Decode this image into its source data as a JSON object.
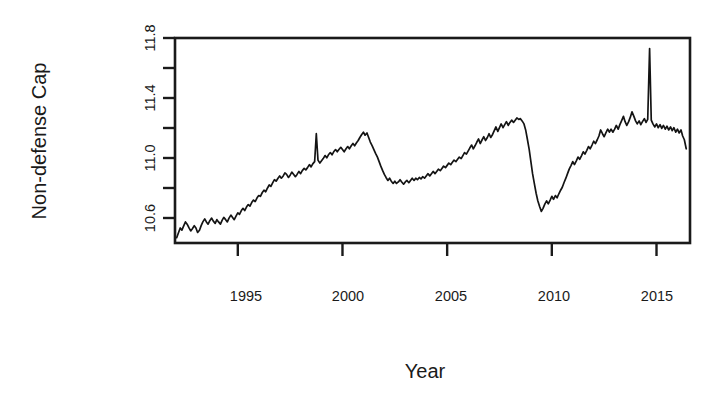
{
  "chart_data": {
    "type": "line",
    "title": "",
    "subtitle": "",
    "xlabel": "Year",
    "ylabel": "Non-defense Cap",
    "xlim": [
      1992.0,
      2016.6
    ],
    "ylim": [
      10.46,
      11.82
    ],
    "grid": false,
    "legend": null,
    "legend_position": "none",
    "xticks": [
      1995,
      2000,
      2005,
      2010,
      2015
    ],
    "xtick_labels": [
      "1995",
      "2000",
      "2005",
      "2010",
      "2015"
    ],
    "yticks": [
      10.6,
      10.8,
      11.0,
      11.2,
      11.4,
      11.6,
      11.8
    ],
    "ytick_labels": [
      "10.6",
      "",
      "11.0",
      "",
      "11.4",
      "",
      "11.8"
    ],
    "series": [
      {
        "name": "Non-defense Cap",
        "color": "#141414",
        "x": [
          1992.08,
          1992.17,
          1992.25,
          1992.33,
          1992.42,
          1992.5,
          1992.58,
          1992.67,
          1992.75,
          1992.83,
          1992.92,
          1993.0,
          1993.08,
          1993.17,
          1993.25,
          1993.33,
          1993.42,
          1993.5,
          1993.58,
          1993.67,
          1993.75,
          1993.83,
          1993.92,
          1994.0,
          1994.08,
          1994.17,
          1994.25,
          1994.33,
          1994.42,
          1994.5,
          1994.58,
          1994.67,
          1994.75,
          1994.83,
          1994.92,
          1995.0,
          1995.08,
          1995.17,
          1995.25,
          1995.33,
          1995.42,
          1995.5,
          1995.58,
          1995.67,
          1995.75,
          1995.83,
          1995.92,
          1996.0,
          1996.08,
          1996.17,
          1996.25,
          1996.33,
          1996.42,
          1996.5,
          1996.58,
          1996.67,
          1996.75,
          1996.83,
          1996.92,
          1997.0,
          1997.08,
          1997.17,
          1997.25,
          1997.33,
          1997.42,
          1997.5,
          1997.58,
          1997.67,
          1997.75,
          1997.83,
          1997.92,
          1998.0,
          1998.08,
          1998.17,
          1998.25,
          1998.33,
          1998.42,
          1998.5,
          1998.58,
          1998.67,
          1998.75,
          1998.83,
          1998.92,
          1999.0,
          1999.08,
          1999.17,
          1999.25,
          1999.33,
          1999.42,
          1999.5,
          1999.58,
          1999.67,
          1999.75,
          1999.83,
          1999.92,
          2000.0,
          2000.08,
          2000.17,
          2000.25,
          2000.33,
          2000.42,
          2000.5,
          2000.58,
          2000.67,
          2000.75,
          2000.83,
          2000.92,
          2001.0,
          2001.08,
          2001.17,
          2001.25,
          2001.33,
          2001.42,
          2001.5,
          2001.58,
          2001.67,
          2001.75,
          2001.83,
          2001.92,
          2002.0,
          2002.08,
          2002.17,
          2002.25,
          2002.33,
          2002.42,
          2002.5,
          2002.58,
          2002.67,
          2002.75,
          2002.83,
          2002.92,
          2003.0,
          2003.08,
          2003.17,
          2003.25,
          2003.33,
          2003.42,
          2003.5,
          2003.58,
          2003.67,
          2003.75,
          2003.83,
          2003.92,
          2004.0,
          2004.08,
          2004.17,
          2004.25,
          2004.33,
          2004.42,
          2004.5,
          2004.58,
          2004.67,
          2004.75,
          2004.83,
          2004.92,
          2005.0,
          2005.08,
          2005.17,
          2005.25,
          2005.33,
          2005.42,
          2005.5,
          2005.58,
          2005.67,
          2005.75,
          2005.83,
          2005.92,
          2006.0,
          2006.08,
          2006.17,
          2006.25,
          2006.33,
          2006.42,
          2006.5,
          2006.58,
          2006.67,
          2006.75,
          2006.83,
          2006.92,
          2007.0,
          2007.08,
          2007.17,
          2007.25,
          2007.33,
          2007.42,
          2007.5,
          2007.58,
          2007.67,
          2007.75,
          2007.83,
          2007.92,
          2008.0,
          2008.08,
          2008.17,
          2008.25,
          2008.33,
          2008.42,
          2008.5,
          2008.58,
          2008.67,
          2008.75,
          2008.83,
          2008.92,
          2009.0,
          2009.08,
          2009.17,
          2009.25,
          2009.33,
          2009.42,
          2009.5,
          2009.58,
          2009.67,
          2009.75,
          2009.83,
          2009.92,
          2010.0,
          2010.08,
          2010.17,
          2010.25,
          2010.33,
          2010.42,
          2010.5,
          2010.58,
          2010.67,
          2010.75,
          2010.83,
          2010.92,
          2011.0,
          2011.08,
          2011.17,
          2011.25,
          2011.33,
          2011.42,
          2011.5,
          2011.58,
          2011.67,
          2011.75,
          2011.83,
          2011.92,
          2012.0,
          2012.08,
          2012.17,
          2012.25,
          2012.33,
          2012.42,
          2012.5,
          2012.58,
          2012.67,
          2012.75,
          2012.83,
          2012.92,
          2013.0,
          2013.08,
          2013.17,
          2013.25,
          2013.33,
          2013.42,
          2013.5,
          2013.58,
          2013.67,
          2013.75,
          2013.83,
          2013.92,
          2014.0,
          2014.08,
          2014.17,
          2014.25,
          2014.33,
          2014.42,
          2014.5,
          2014.58,
          2014.67,
          2014.75,
          2014.83,
          2014.92,
          2015.0,
          2015.08,
          2015.17,
          2015.25,
          2015.33,
          2015.42,
          2015.5,
          2015.58,
          2015.67,
          2015.75,
          2015.83,
          2015.92,
          2016.0,
          2016.08,
          2016.17,
          2016.25,
          2016.33,
          2016.42
        ],
        "y": [
          10.495,
          10.53,
          10.56,
          10.545,
          10.575,
          10.6,
          10.585,
          10.56,
          10.54,
          10.555,
          10.575,
          10.56,
          10.53,
          10.545,
          10.575,
          10.6,
          10.62,
          10.6,
          10.585,
          10.61,
          10.625,
          10.605,
          10.59,
          10.615,
          10.6,
          10.585,
          10.61,
          10.63,
          10.615,
          10.6,
          10.625,
          10.645,
          10.63,
          10.615,
          10.64,
          10.66,
          10.65,
          10.675,
          10.69,
          10.675,
          10.7,
          10.715,
          10.705,
          10.73,
          10.745,
          10.735,
          10.76,
          10.775,
          10.77,
          10.795,
          10.81,
          10.8,
          10.825,
          10.845,
          10.835,
          10.86,
          10.88,
          10.87,
          10.89,
          10.905,
          10.89,
          10.905,
          10.925,
          10.915,
          10.895,
          10.91,
          10.93,
          10.915,
          10.9,
          10.915,
          10.935,
          10.92,
          10.94,
          10.955,
          10.945,
          10.96,
          10.98,
          10.965,
          10.985,
          11.0,
          11.185,
          11.01,
          10.99,
          11.005,
          11.02,
          11.04,
          11.025,
          11.045,
          11.06,
          11.045,
          11.065,
          11.08,
          11.065,
          11.08,
          11.095,
          11.08,
          11.065,
          11.085,
          11.1,
          11.085,
          11.105,
          11.12,
          11.105,
          11.125,
          11.14,
          11.16,
          11.18,
          11.195,
          11.175,
          11.19,
          11.16,
          11.13,
          11.105,
          11.08,
          11.055,
          11.03,
          11.0,
          10.97,
          10.94,
          10.915,
          10.895,
          10.875,
          10.89,
          10.87,
          10.855,
          10.87,
          10.855,
          10.865,
          10.88,
          10.865,
          10.85,
          10.865,
          10.875,
          10.86,
          10.875,
          10.89,
          10.875,
          10.89,
          10.88,
          10.895,
          10.885,
          10.9,
          10.89,
          10.905,
          10.92,
          10.905,
          10.92,
          10.935,
          10.92,
          10.935,
          10.95,
          10.94,
          10.955,
          10.97,
          10.96,
          10.975,
          10.99,
          10.98,
          10.995,
          11.01,
          11.0,
          11.015,
          11.03,
          11.02,
          11.04,
          11.06,
          11.05,
          11.07,
          11.09,
          11.11,
          11.085,
          11.105,
          11.13,
          11.15,
          11.12,
          11.145,
          11.165,
          11.14,
          11.16,
          11.185,
          11.16,
          11.18,
          11.205,
          11.23,
          11.2,
          11.225,
          11.25,
          11.225,
          11.245,
          11.265,
          11.24,
          11.26,
          11.275,
          11.26,
          11.275,
          11.29,
          11.28,
          11.285,
          11.27,
          11.25,
          11.21,
          11.15,
          11.08,
          11.0,
          10.92,
          10.85,
          10.79,
          10.74,
          10.7,
          10.67,
          10.69,
          10.72,
          10.74,
          10.72,
          10.745,
          10.77,
          10.75,
          10.775,
          10.76,
          10.785,
          10.81,
          10.83,
          10.86,
          10.89,
          10.92,
          10.95,
          10.975,
          11.0,
          10.98,
          11.005,
          11.03,
          11.015,
          11.04,
          11.065,
          11.05,
          11.075,
          11.1,
          11.085,
          11.11,
          11.135,
          11.12,
          11.145,
          11.17,
          11.21,
          11.185,
          11.165,
          11.19,
          11.215,
          11.195,
          11.215,
          11.195,
          11.215,
          11.24,
          11.215,
          11.245,
          11.27,
          11.3,
          11.265,
          11.24,
          11.265,
          11.295,
          11.33,
          11.3,
          11.27,
          11.25,
          11.27,
          11.245,
          11.265,
          11.285,
          11.26,
          11.28,
          11.75,
          11.275,
          11.25,
          11.23,
          11.25,
          11.225,
          11.245,
          11.22,
          11.24,
          11.215,
          11.235,
          11.21,
          11.23,
          11.205,
          11.225,
          11.195,
          11.215,
          11.19,
          11.21,
          11.17,
          11.145,
          11.085
        ]
      }
    ]
  },
  "axes": {
    "ylabel": "Non-defense Cap",
    "xlabel": "Year",
    "ytick_labels": [
      "11.8",
      "11.4",
      "11.0",
      "10.6"
    ],
    "xtick_labels": [
      "1995",
      "2000",
      "2005",
      "2010",
      "2015"
    ]
  }
}
